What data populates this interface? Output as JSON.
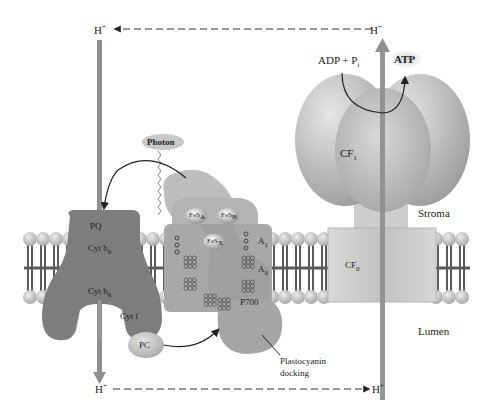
{
  "diagram": {
    "regions": {
      "stroma": "Stroma",
      "lumen": "Lumen"
    },
    "proton_labels": {
      "top_left": "H",
      "top_right": "H",
      "bottom_left": "H",
      "bottom_right": "H",
      "charge": "+"
    },
    "atp_synthase": {
      "cf1": "CF",
      "cf1_sub": "1",
      "cf0": "CF",
      "cf0_sub": "0",
      "substrate_adp": "ADP",
      "plus": "+",
      "substrate_pi": "P",
      "substrate_pi_sub": "i",
      "product": "ATP"
    },
    "cytochrome_complex": {
      "pq": "PQ",
      "cyt_b6_upper": "Cyt b",
      "cyt_b6_upper_sub": "6",
      "cyt_b6_lower": "Cyt b",
      "cyt_b6_lower_sub": "6",
      "cyt_f": "Cyt f"
    },
    "photosystem_i": {
      "photon": "Photon",
      "fes_a": "FeS",
      "fes_a_sub": "A",
      "fes_b": "FeS",
      "fes_b_sub": "B",
      "fes_x": "FeS",
      "fes_x_sub": "X",
      "a1": "A",
      "a1_sub": "1",
      "a0": "A",
      "a0_sub": "0",
      "p700": "P700"
    },
    "plastocyanin": {
      "pc": "PC",
      "docking_line1": "Plastocyanin",
      "docking_line2": "docking"
    },
    "colors": {
      "membrane_head": "#c9c9c9",
      "membrane_tail": "#5a5a5a",
      "cyt_complex": "#7d7d7d",
      "psi": "#a8a8a8",
      "atp_synthase": "#c4c4c4",
      "proton_arrow": "#8f8f8f",
      "dashed_arrow": "#333333"
    }
  }
}
